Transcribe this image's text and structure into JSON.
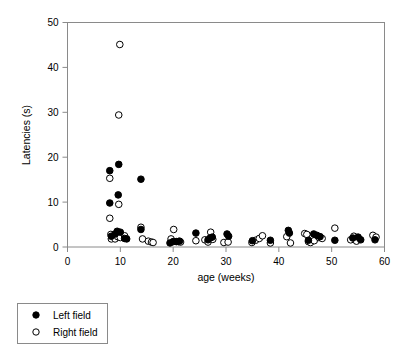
{
  "chart_data": {
    "type": "scatter",
    "title": "",
    "xlabel": "age (weeks)",
    "ylabel": "Latencies (s)",
    "xlim": [
      0,
      60
    ],
    "ylim": [
      0,
      50
    ],
    "xticks": [
      0,
      10,
      20,
      30,
      40,
      50,
      60
    ],
    "yticks": [
      0,
      10,
      20,
      30,
      40,
      50
    ],
    "grid": false,
    "legend_position": "below-left",
    "marker_colors": {
      "left_field": "#000000",
      "right_field": "#ffffff",
      "marker_edge": "#000000",
      "axis": "#8a8a8a"
    },
    "series": [
      {
        "name": "Left field",
        "marker": "filled-circle",
        "points": [
          [
            8.0,
            17.0
          ],
          [
            8.0,
            9.8
          ],
          [
            9.7,
            18.4
          ],
          [
            9.6,
            11.6
          ],
          [
            9.4,
            3.5
          ],
          [
            9.0,
            2.9
          ],
          [
            8.3,
            2.4
          ],
          [
            10.0,
            3.3
          ],
          [
            10.8,
            1.9
          ],
          [
            11.2,
            1.8
          ],
          [
            13.9,
            15.1
          ],
          [
            13.9,
            3.9
          ],
          [
            19.4,
            0.9
          ],
          [
            20.0,
            1.2
          ],
          [
            20.6,
            1.2
          ],
          [
            21.2,
            1.3
          ],
          [
            24.3,
            3.1
          ],
          [
            26.6,
            1.6
          ],
          [
            27.0,
            2.0
          ],
          [
            27.4,
            2.2
          ],
          [
            30.2,
            2.9
          ],
          [
            30.5,
            2.4
          ],
          [
            35.0,
            1.4
          ],
          [
            38.4,
            1.5
          ],
          [
            41.8,
            3.7
          ],
          [
            42.0,
            3.1
          ],
          [
            45.6,
            1.5
          ],
          [
            46.6,
            2.9
          ],
          [
            47.2,
            2.6
          ],
          [
            47.8,
            2.3
          ],
          [
            50.6,
            1.5
          ],
          [
            54.0,
            2.0
          ],
          [
            55.0,
            2.2
          ],
          [
            55.5,
            1.6
          ],
          [
            58.2,
            1.6
          ]
        ]
      },
      {
        "name": "Right field",
        "marker": "open-circle",
        "points": [
          [
            9.9,
            45.1
          ],
          [
            9.7,
            29.4
          ],
          [
            8.0,
            15.3
          ],
          [
            9.7,
            9.5
          ],
          [
            8.0,
            6.4
          ],
          [
            8.2,
            2.8
          ],
          [
            8.3,
            1.8
          ],
          [
            9.0,
            1.8
          ],
          [
            9.5,
            2.3
          ],
          [
            10.0,
            2.1
          ],
          [
            10.8,
            2.5
          ],
          [
            13.9,
            4.4
          ],
          [
            14.2,
            1.8
          ],
          [
            15.3,
            1.3
          ],
          [
            15.9,
            1.1
          ],
          [
            16.2,
            1.0
          ],
          [
            19.6,
            1.8
          ],
          [
            20.1,
            3.9
          ],
          [
            21.0,
            1.2
          ],
          [
            21.4,
            1.1
          ],
          [
            24.3,
            1.4
          ],
          [
            26.0,
            1.6
          ],
          [
            26.6,
            1.1
          ],
          [
            27.1,
            3.3
          ],
          [
            27.5,
            1.7
          ],
          [
            29.6,
            1.0
          ],
          [
            30.4,
            1.1
          ],
          [
            34.9,
            1.0
          ],
          [
            35.6,
            1.5
          ],
          [
            36.3,
            1.9
          ],
          [
            36.9,
            2.5
          ],
          [
            38.4,
            0.9
          ],
          [
            41.5,
            2.3
          ],
          [
            42.2,
            0.9
          ],
          [
            44.9,
            3.0
          ],
          [
            45.3,
            2.8
          ],
          [
            45.6,
            1.2
          ],
          [
            46.0,
            1.0
          ],
          [
            46.7,
            1.4
          ],
          [
            47.6,
            2.1
          ],
          [
            48.2,
            1.9
          ],
          [
            50.6,
            4.2
          ],
          [
            53.6,
            1.6
          ],
          [
            54.2,
            2.4
          ],
          [
            54.7,
            1.3
          ],
          [
            57.8,
            2.6
          ],
          [
            58.4,
            2.2
          ]
        ]
      }
    ],
    "legend": [
      {
        "label": "Left field",
        "marker": "filled-circle"
      },
      {
        "label": "Right field",
        "marker": "open-circle"
      }
    ]
  }
}
